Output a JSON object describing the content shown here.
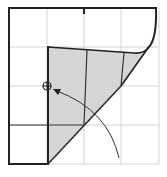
{
  "diagram": {
    "colors": {
      "background": "#ffffff",
      "grid": "#d4d4d4",
      "edge": "#222222",
      "flap_fill": "#d6d6d6",
      "fold_line": "#555555"
    },
    "grid": {
      "x": [
        9,
        47,
        84,
        121,
        159
      ],
      "y": [
        8,
        47,
        86,
        125,
        164
      ]
    },
    "marker": {
      "type": "circle-crosshair",
      "cx": 47,
      "cy": 86,
      "r": 4
    },
    "fold_line": {
      "style": "dotted",
      "from": [
        121,
        86
      ],
      "to": [
        48,
        164
      ]
    },
    "arrow": {
      "from": [
        119,
        158
      ],
      "to": [
        55,
        90
      ],
      "direction": "up-left"
    }
  }
}
